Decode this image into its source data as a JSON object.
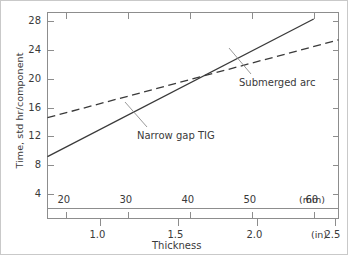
{
  "chart_data": {
    "type": "line",
    "title": "",
    "ylabel": "Time, std hr/component",
    "xlabel": "Thickness",
    "ylim": [
      2,
      29.2
    ],
    "yticks": [
      4,
      8,
      12,
      16,
      20,
      24,
      28
    ],
    "ytick_labels": [
      "4",
      "8",
      "12",
      "16",
      "20",
      "24",
      "28"
    ],
    "x_primary": {
      "unit_label": "(mm)",
      "ticks": [
        20,
        30,
        40,
        50,
        60
      ],
      "tick_labels": [
        "20",
        "30",
        "40",
        "50",
        "60"
      ],
      "range": [
        17.0,
        64.0
      ]
    },
    "x_secondary": {
      "unit_label": "(in)",
      "ticks": [
        1.0,
        1.5,
        2.0,
        2.5
      ],
      "tick_labels": [
        "1.0",
        "1.5",
        "2.0",
        "2.5"
      ],
      "range": [
        0.669,
        2.52
      ]
    },
    "grid": false,
    "legend": "inline-annotations",
    "series": [
      {
        "name": "Narrow gap TIG",
        "style": "solid",
        "color": "#3a3a3a",
        "points": [
          [
            17.0,
            9.2
          ],
          [
            60.0,
            28.3
          ]
        ]
      },
      {
        "name": "Submerged arc",
        "style": "dashed",
        "color": "#3a3a3a",
        "points": [
          [
            17.0,
            14.6
          ],
          [
            64.0,
            25.4
          ]
        ]
      }
    ],
    "annotations": [
      {
        "text": "Narrow gap TIG",
        "target_series": "Narrow gap TIG"
      },
      {
        "text": "Submerged arc",
        "target_series": "Submerged arc"
      }
    ]
  }
}
